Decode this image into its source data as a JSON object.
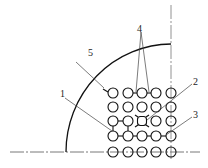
{
  "figure": {
    "type": "technical drawing",
    "colors": {
      "line": "#1a1a1a",
      "leader": "#444444",
      "centerline": "#666666",
      "background": "#ffffff"
    },
    "callouts": [
      {
        "id": "5",
        "label": "5",
        "x": 72,
        "y": 53
      },
      {
        "id": "4",
        "label": "4",
        "x": 137,
        "y": 24
      },
      {
        "id": "2",
        "label": "2",
        "x": 193,
        "y": 79
      },
      {
        "id": "1",
        "label": "1",
        "x": 60,
        "y": 92
      },
      {
        "id": "3",
        "label": "3",
        "x": 193,
        "y": 113
      }
    ],
    "grid": {
      "cols_x": [
        113,
        128,
        142,
        156,
        171
      ],
      "rows_y": [
        93,
        107,
        121,
        136,
        152
      ],
      "radius": 5
    }
  }
}
